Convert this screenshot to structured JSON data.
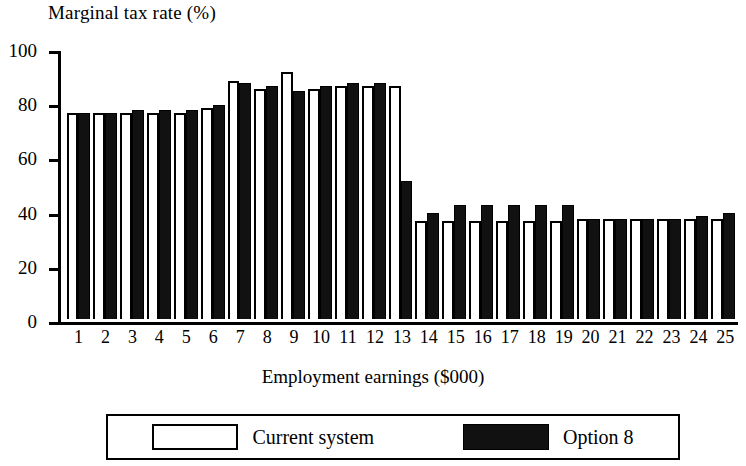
{
  "chart_data": {
    "type": "bar",
    "title": "",
    "ylabel": "Marginal tax rate (%)",
    "xlabel": "Employment earnings ($000)",
    "ylim": [
      0,
      100
    ],
    "yticks": [
      0,
      20,
      40,
      60,
      80,
      100
    ],
    "grid": false,
    "legend_position": "bottom",
    "categories": [
      "1",
      "2",
      "3",
      "4",
      "5",
      "6",
      "7",
      "8",
      "9",
      "10",
      "11",
      "12",
      "13",
      "14",
      "15",
      "16",
      "17",
      "18",
      "19",
      "20",
      "21",
      "22",
      "23",
      "24",
      "25"
    ],
    "series": [
      {
        "name": "Current system",
        "color": "#ffffff",
        "values": [
          76,
          76,
          76,
          76,
          76,
          78,
          88,
          85,
          91,
          85,
          86,
          86,
          86,
          36,
          36,
          36,
          36,
          36,
          36,
          37,
          37,
          37,
          37,
          37,
          37
        ]
      },
      {
        "name": "Option 8",
        "color": "#111111",
        "values": [
          76,
          76,
          77,
          77,
          77,
          79,
          87,
          86,
          84,
          86,
          87,
          87,
          51,
          39,
          42,
          42,
          42,
          42,
          42,
          37,
          37,
          37,
          37,
          38,
          39
        ]
      }
    ]
  },
  "legend": {
    "entries": [
      {
        "label": "Current system",
        "swatch": "outline-white"
      },
      {
        "label": "Option 8",
        "swatch": "solid-black"
      }
    ]
  }
}
